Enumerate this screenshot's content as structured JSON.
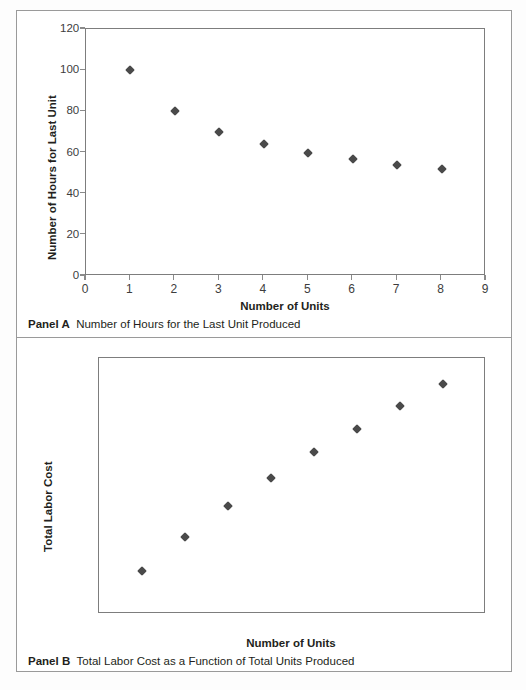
{
  "figure": {
    "panels": [
      {
        "tag": "Panel A",
        "description": "Number of Hours for the Last Unit Produced"
      },
      {
        "tag": "Panel B",
        "description": "Total Labor Cost as a Function of Total Units Produced"
      }
    ]
  },
  "chart_data": [
    {
      "type": "scatter",
      "title": "",
      "panel": "Panel A",
      "caption": "Number of Hours for the Last Unit Produced",
      "xlabel": "Number of Units",
      "ylabel": "Number of Hours for Last Unit",
      "x": [
        1,
        2,
        3,
        4,
        5,
        6,
        7,
        8
      ],
      "values": [
        100,
        80,
        70,
        64,
        60,
        57,
        54,
        52
      ],
      "xlim": [
        0,
        9
      ],
      "ylim": [
        0,
        120
      ],
      "xticks": [
        "0",
        "1",
        "2",
        "3",
        "4",
        "5",
        "6",
        "7",
        "8",
        "9"
      ],
      "yticks": [
        "0",
        "20",
        "40",
        "60",
        "80",
        "100",
        "120"
      ],
      "ytick_values": [
        0,
        20,
        40,
        60,
        80,
        100,
        120
      ],
      "xtick_values": [
        0,
        1,
        2,
        3,
        4,
        5,
        6,
        7,
        8,
        9
      ],
      "grid": false,
      "legend": false,
      "marker": "diamond",
      "marker_color": "#4a4a4a"
    },
    {
      "type": "scatter",
      "title": "",
      "panel": "Panel B",
      "caption": "Total Labor Cost as a Function of Total Units Produced",
      "xlabel": "Number of Units",
      "ylabel": "Total Labor Cost",
      "x": [
        1,
        2,
        3,
        4,
        5,
        6,
        7,
        8
      ],
      "values": [
        5000,
        9000,
        12600,
        15950,
        18950,
        21700,
        24400,
        27000
      ],
      "xlim": [
        0,
        9
      ],
      "ylim": [
        0,
        30000
      ],
      "xticks": [
        "0",
        "1",
        "2",
        "3",
        "4",
        "5",
        "6",
        "7",
        "8",
        "9"
      ],
      "yticks": [
        "$0",
        "$5,000",
        "$10,000",
        "$15,000",
        "$20,000",
        "$25,000",
        "$30,000"
      ],
      "ytick_values": [
        0,
        5000,
        10000,
        15000,
        20000,
        25000,
        30000
      ],
      "xtick_values": [
        0,
        1,
        2,
        3,
        4,
        5,
        6,
        7,
        8,
        9
      ],
      "grid": false,
      "legend": false,
      "marker": "diamond",
      "marker_color": "#4a4a4a"
    }
  ]
}
